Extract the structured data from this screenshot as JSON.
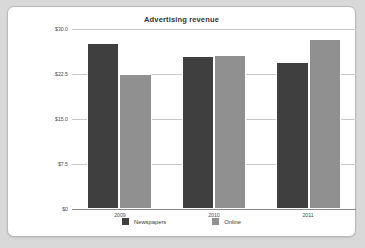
{
  "panel": {
    "background_color": "#ffffff",
    "border_color": "#b9b9b9",
    "outer_background_color": "#d9d9d9"
  },
  "chart_data": {
    "type": "bar",
    "title": "Advertising revenue",
    "xlabel": "",
    "ylabel": "",
    "categories": [
      "2009",
      "2010",
      "2011"
    ],
    "series": [
      {
        "name": "Newspapers",
        "color": "#3f3f3f",
        "values": [
          27.7,
          25.5,
          24.5
        ]
      },
      {
        "name": "Online",
        "color": "#909090",
        "values": [
          22.5,
          25.7,
          28.3
        ]
      }
    ],
    "ylim": [
      0,
      30
    ],
    "ytick_values": [
      30.0,
      22.5,
      15.0,
      7.5,
      0
    ],
    "ytick_labels": [
      "$30.0",
      "$22.5",
      "$15.0",
      "$7.5",
      "$0"
    ],
    "grid": true,
    "legend_position": "bottom"
  }
}
